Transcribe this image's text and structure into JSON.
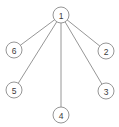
{
  "figure": {
    "background_color": "#ffffff",
    "width": 119,
    "height": 127
  },
  "style": {
    "edge_color": "#8a8a8a",
    "node_stroke_color": "#8a8a8a",
    "node_fill_color": "#ffffff",
    "label_color": "#3b3b3b",
    "node_radius": 8,
    "stroke_width": 0.9,
    "label_font_size": 8.5
  },
  "chart_data": {
    "type": "diagram",
    "diagram_type": "star-graph",
    "title": "",
    "xlabel": "",
    "ylabel": "",
    "legend": [],
    "grid": false,
    "node_count": 6,
    "edge_count": 5,
    "hub_node": "1",
    "leaf_nodes": [
      "2",
      "3",
      "4",
      "5",
      "6"
    ],
    "nodes": [
      {
        "id": "1",
        "label": "1",
        "x": 61,
        "y": 15,
        "role": "hub",
        "degree": 5
      },
      {
        "id": "2",
        "label": "2",
        "x": 106,
        "y": 51,
        "role": "leaf",
        "degree": 1
      },
      {
        "id": "3",
        "label": "3",
        "x": 106,
        "y": 91,
        "role": "leaf",
        "degree": 1
      },
      {
        "id": "4",
        "label": "4",
        "x": 61,
        "y": 115,
        "role": "leaf",
        "degree": 1
      },
      {
        "id": "5",
        "label": "5",
        "x": 14,
        "y": 90,
        "role": "leaf",
        "degree": 1
      },
      {
        "id": "6",
        "label": "6",
        "x": 14,
        "y": 50,
        "role": "leaf",
        "degree": 1
      }
    ],
    "edges": [
      {
        "from": "1",
        "to": "2",
        "label": ""
      },
      {
        "from": "1",
        "to": "3",
        "label": ""
      },
      {
        "from": "1",
        "to": "4",
        "label": ""
      },
      {
        "from": "1",
        "to": "5",
        "label": ""
      },
      {
        "from": "1",
        "to": "6",
        "label": ""
      }
    ]
  }
}
